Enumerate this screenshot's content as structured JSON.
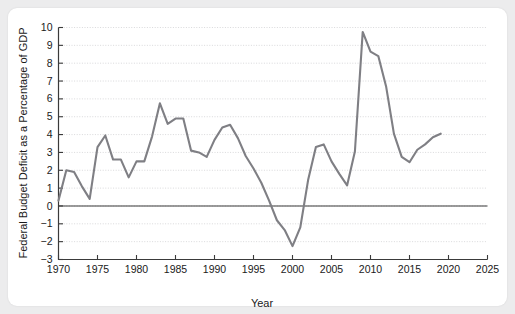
{
  "figure": {
    "background_color": "#ececed",
    "panel_color": "#ffffff",
    "line_color": "#7f7f84",
    "axis_color": "#3a3a3a",
    "grid_color": "#c9c9cc"
  },
  "chart_data": {
    "type": "line",
    "title": "",
    "xlabel": "Year",
    "ylabel": "Federal Budget Deficit as a Percentage of GDP",
    "xlim": [
      1970,
      2025
    ],
    "ylim": [
      -3,
      10
    ],
    "xticks": [
      1970,
      1975,
      1980,
      1985,
      1990,
      1995,
      2000,
      2005,
      2010,
      2015,
      2020,
      2025
    ],
    "xticklabels": [
      "1970",
      "1975",
      "1980",
      "1985",
      "1990",
      "1995",
      "2000",
      "2005",
      "2010",
      "2015",
      "2020",
      "2025"
    ],
    "yticks": [
      -3,
      -2,
      -1,
      0,
      1,
      2,
      3,
      4,
      5,
      6,
      7,
      8,
      9,
      10
    ],
    "yticklabels": [
      "−3",
      "−2",
      "−1",
      "0",
      "1",
      "2",
      "3",
      "4",
      "5",
      "6",
      "7",
      "8",
      "9",
      "10"
    ],
    "grid": true,
    "grid_axis": "y",
    "zero_line": true,
    "legend": null,
    "series": [
      {
        "name": "Federal Budget Deficit (% of GDP)",
        "color": "#7f7f84",
        "x": [
          1970,
          1971,
          1972,
          1973,
          1974,
          1975,
          1976,
          1977,
          1978,
          1979,
          1980,
          1981,
          1982,
          1983,
          1984,
          1985,
          1986,
          1987,
          1988,
          1989,
          1990,
          1991,
          1992,
          1993,
          1994,
          1995,
          1996,
          1997,
          1998,
          1999,
          2000,
          2001,
          2002,
          2003,
          2004,
          2005,
          2006,
          2007,
          2008,
          2009,
          2010,
          2011,
          2012,
          2013,
          2014,
          2015,
          2016,
          2017,
          2018,
          2019
        ],
        "y": [
          0.3,
          2.0,
          1.9,
          1.1,
          0.4,
          3.3,
          3.95,
          2.6,
          2.6,
          1.6,
          2.5,
          2.5,
          3.9,
          5.75,
          4.6,
          4.9,
          4.9,
          3.1,
          3.0,
          2.75,
          3.7,
          4.4,
          4.55,
          3.8,
          2.8,
          2.1,
          1.3,
          0.3,
          -0.8,
          -1.35,
          -2.25,
          -1.2,
          1.45,
          3.3,
          3.45,
          2.5,
          1.8,
          1.15,
          3.05,
          9.75,
          8.65,
          8.4,
          6.7,
          4.05,
          2.75,
          2.45,
          3.15,
          3.45,
          3.85,
          4.05
        ]
      }
    ]
  }
}
